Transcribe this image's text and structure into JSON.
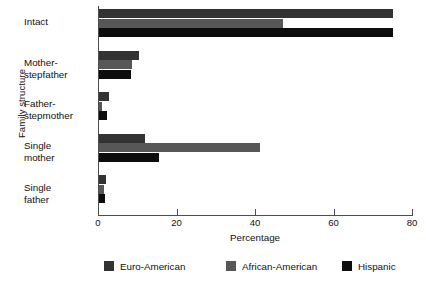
{
  "chart_data": {
    "type": "bar",
    "orientation": "horizontal",
    "title": "",
    "xlabel": "Percentage",
    "ylabel": "Family structure",
    "xlim": [
      0,
      80
    ],
    "xticks": [
      0,
      20,
      40,
      60,
      80
    ],
    "xtick_labels": [
      "0",
      "20",
      "40",
      "60",
      "80"
    ],
    "grid": false,
    "legend_position": "bottom",
    "categories": [
      "Intact",
      "Mother-stepfather",
      "Father-stepmother",
      "Single mother",
      "Single father"
    ],
    "category_lines": [
      [
        "Intact"
      ],
      [
        "Mother-",
        "stepfather"
      ],
      [
        "Father-",
        "stepmother"
      ],
      [
        "Single",
        "mother"
      ],
      [
        "Single",
        "father"
      ]
    ],
    "series": [
      {
        "name": "Euro-American",
        "color": "#333333",
        "values": [
          75,
          10.3,
          2.6,
          11.8,
          1.8
        ]
      },
      {
        "name": "African-American",
        "color": "#575757",
        "values": [
          47,
          8.5,
          0.8,
          41,
          1.3
        ]
      },
      {
        "name": "Hispanic",
        "color": "#0d0d0d",
        "values": [
          75,
          8.2,
          2.1,
          15.4,
          1.5
        ]
      }
    ]
  },
  "axis": {
    "x_title": "Percentage",
    "y_title": "Family structure"
  }
}
